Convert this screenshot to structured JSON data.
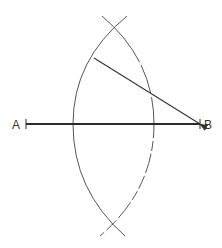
{
  "diagram": {
    "title": "",
    "points": {
      "A": {
        "label": "A",
        "x": 26,
        "y": 124
      },
      "B": {
        "label": "B",
        "x": 200,
        "y": 124
      }
    },
    "segment_AB": {
      "from": "A",
      "to": "B",
      "stroke": "#2a2a2a",
      "width": 1.8
    },
    "arc_centered_B": {
      "style": "solid",
      "stroke": "#555555"
    },
    "arc_centered_A": {
      "style": "partly-dashed",
      "stroke": "#555555"
    },
    "arrow": {
      "from": "B",
      "to_on_arc": [
        92,
        57
      ],
      "stroke": "#333333"
    },
    "intersections": {
      "upper": [
        114,
        28
      ],
      "lower": [
        112,
        223
      ]
    }
  }
}
